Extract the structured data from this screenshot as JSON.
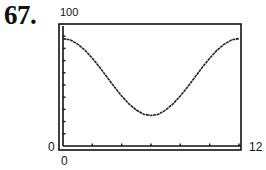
{
  "problem": {
    "number_label": "67."
  },
  "chart_data": {
    "type": "line",
    "title": "",
    "xlabel": "",
    "ylabel": "",
    "xlim": [
      0,
      12
    ],
    "ylim": [
      0,
      100
    ],
    "x_tick_step": 2,
    "y_tick_step": 10,
    "grid": false,
    "labels": {
      "ymax": "100",
      "ymin": "0",
      "xmin": "0",
      "xmax": "12"
    },
    "series": [
      {
        "name": "curve",
        "x": [
          0,
          0.5,
          1,
          1.5,
          2,
          2.5,
          3,
          3.5,
          4,
          4.5,
          5,
          5.5,
          6,
          6.5,
          7,
          7.5,
          8,
          8.5,
          9,
          9.5,
          10,
          10.5,
          11,
          11.5,
          12
        ],
        "y": [
          88,
          87,
          83.5,
          78.5,
          72,
          64.5,
          56.5,
          48.5,
          41,
          34.5,
          29.5,
          26,
          25,
          26,
          29.5,
          34.5,
          41,
          48.5,
          56.5,
          64.5,
          72,
          78.5,
          83.5,
          87,
          88
        ]
      }
    ],
    "colors": {
      "line": "#222222",
      "frame": "#111111"
    }
  }
}
